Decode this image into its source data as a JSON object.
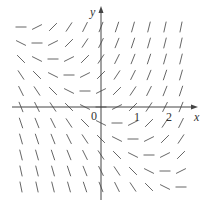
{
  "diagram": {
    "type": "slope-field",
    "equation": "y' = x + y",
    "colors": {
      "axis": "#444444",
      "segment": "#555555",
      "background": "#ffffff"
    },
    "labels": {
      "x_axis": "x",
      "y_axis": "y",
      "origin": "0",
      "tick_1": "1",
      "tick_2": "2"
    },
    "grid": {
      "x_values": [
        -2.5,
        -2,
        -1.5,
        -1,
        -0.5,
        0,
        0.5,
        1,
        1.5,
        2,
        2.5
      ],
      "y_values": [
        2.5,
        2,
        1.5,
        1,
        0.5,
        0,
        -0.5,
        -1,
        -1.5,
        -2,
        -2.5
      ],
      "segment_length_px": 11
    },
    "layout": {
      "origin_px": [
        101,
        107
      ],
      "unit_px": 32,
      "x_axis_range_px": [
        12,
        198
      ],
      "y_axis_range_px": [
        6,
        200
      ]
    }
  }
}
